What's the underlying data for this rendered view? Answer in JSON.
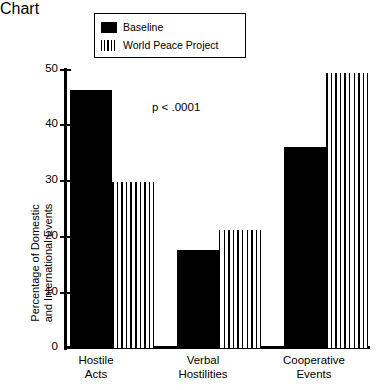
{
  "chart_data": {
    "type": "bar",
    "title": "",
    "subtitle": "",
    "xlabel": "",
    "ylabel": "Percentage of Domestic and International Events",
    "ylabel_line1": "Percentage of Domestic",
    "ylabel_line2": "and International Events",
    "ylim": [
      0,
      50
    ],
    "yticks": [
      0,
      10,
      20,
      30,
      40,
      50
    ],
    "ytick_labels": [
      "0",
      "10",
      "20",
      "30",
      "40",
      "50"
    ],
    "grid": false,
    "legend_position": "top-center",
    "categories": [
      "Hostile Acts",
      "Verbal Hostilities",
      "Cooperative Events"
    ],
    "category_lines": [
      [
        "Hostile",
        "Acts"
      ],
      [
        "Verbal",
        "Hostilities"
      ],
      [
        "Cooperative",
        "Events"
      ]
    ],
    "series": [
      {
        "name": "Baseline",
        "fill": "solid-black",
        "color": "#000000",
        "values": [
          46.5,
          17.7,
          36.2
        ]
      },
      {
        "name": "World Peace Project",
        "fill": "vertical-stripes",
        "color": "#000000",
        "values": [
          29.9,
          21.2,
          49.4
        ]
      }
    ],
    "annotations": [
      {
        "text": "p < .0001",
        "x_frac": 0.32,
        "y_value": 44
      }
    ]
  },
  "legend": {
    "entries": [
      {
        "label": "Baseline",
        "swatch": "solid-swatch"
      },
      {
        "label": "World Peace Project",
        "swatch": "striped-swatch"
      }
    ]
  },
  "colors": {
    "background": "#ffffff",
    "ink": "#000000"
  }
}
